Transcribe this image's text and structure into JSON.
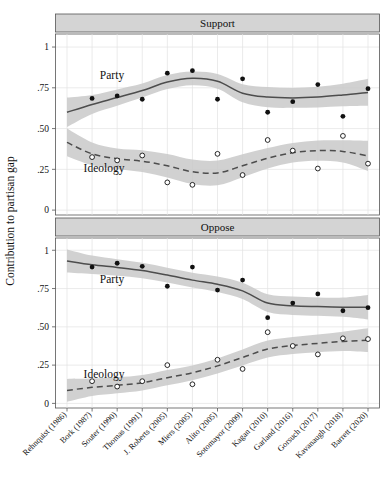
{
  "chart_data": {
    "type": "line",
    "title": "",
    "ylabel": "Contribution to partisan gap",
    "xlabel": "",
    "ylim": [
      -0.03,
      1.08
    ],
    "yticks": [
      0,
      0.25,
      0.5,
      0.75,
      1
    ],
    "ytick_labels": [
      "0",
      ".25",
      ".50",
      ".75",
      "1"
    ],
    "grid": true,
    "legend_position": "inline-annotation",
    "categories": [
      "Rehnquist (1986)",
      "Bork (1987)",
      "Souter (1990)",
      "Thomas (1991)",
      "J. Roberts (2005)",
      "Miers (2005)",
      "Alito (2005)",
      "Sotomayor (2009)",
      "Kagan (2010)",
      "Garland (2016)",
      "Gorsuch (2017)",
      "Kavanaugh (2018)",
      "Barrett (2020)"
    ],
    "panels": [
      {
        "title": "Support",
        "series": [
          {
            "name": "Party",
            "label": "Party",
            "marker": "filled-circle",
            "linestyle": "solid",
            "color": "#4d4d4d",
            "values": [
              null,
              0.685,
              0.7,
              0.68,
              0.84,
              0.855,
              0.68,
              0.805,
              0.6,
              0.665,
              0.77,
              0.575,
              0.745
            ],
            "fit": [
              0.6,
              0.648,
              0.69,
              0.733,
              0.785,
              0.808,
              0.79,
              0.717,
              0.693,
              0.688,
              0.693,
              0.706,
              0.722
            ],
            "ci_low": [
              0.51,
              0.59,
              0.64,
              0.69,
              0.742,
              0.766,
              0.745,
              0.662,
              0.631,
              0.627,
              0.63,
              0.637,
              0.64
            ],
            "ci_high": [
              0.69,
              0.706,
              0.74,
              0.776,
              0.828,
              0.85,
              0.835,
              0.772,
              0.755,
              0.749,
              0.756,
              0.775,
              0.805
            ]
          },
          {
            "name": "Ideology",
            "label": "Ideology",
            "marker": "open-circle",
            "linestyle": "dashed",
            "color": "#4d4d4d",
            "values": [
              null,
              0.325,
              0.305,
              0.335,
              0.17,
              0.155,
              0.345,
              0.215,
              0.43,
              0.365,
              0.255,
              0.455,
              0.285
            ],
            "fit": [
              0.415,
              0.345,
              0.315,
              0.3,
              0.272,
              0.235,
              0.228,
              0.272,
              0.318,
              0.352,
              0.365,
              0.36,
              0.332
            ],
            "ci_low": [
              0.33,
              0.275,
              0.252,
              0.233,
              0.2,
              0.16,
              0.152,
              0.202,
              0.255,
              0.292,
              0.303,
              0.292,
              0.24
            ],
            "ci_high": [
              0.5,
              0.415,
              0.378,
              0.367,
              0.344,
              0.31,
              0.304,
              0.342,
              0.381,
              0.412,
              0.427,
              0.428,
              0.425
            ]
          }
        ]
      },
      {
        "title": "Oppose",
        "series": [
          {
            "name": "Party",
            "label": "Party",
            "marker": "filled-circle",
            "linestyle": "solid",
            "color": "#4d4d4d",
            "values": [
              null,
              0.89,
              0.915,
              0.895,
              0.765,
              0.89,
              0.74,
              0.805,
              0.56,
              0.655,
              0.715,
              0.605,
              0.625
            ],
            "fit": [
              0.93,
              0.905,
              0.888,
              0.868,
              0.838,
              0.805,
              0.778,
              0.735,
              0.655,
              0.638,
              0.632,
              0.628,
              0.628
            ],
            "ci_low": [
              0.855,
              0.845,
              0.834,
              0.818,
              0.79,
              0.757,
              0.728,
              0.682,
              0.597,
              0.578,
              0.572,
              0.565,
              0.548
            ],
            "ci_high": [
              1.005,
              0.965,
              0.942,
              0.918,
              0.886,
              0.853,
              0.828,
              0.788,
              0.713,
              0.698,
              0.692,
              0.691,
              0.708
            ]
          },
          {
            "name": "Ideology",
            "label": "Ideology",
            "marker": "open-circle",
            "linestyle": "dashed",
            "color": "#4d4d4d",
            "values": [
              null,
              0.145,
              0.11,
              0.145,
              0.25,
              0.125,
              0.285,
              0.225,
              0.465,
              0.375,
              0.32,
              0.425,
              0.42
            ],
            "fit": [
              0.085,
              0.105,
              0.118,
              0.135,
              0.168,
              0.2,
              0.245,
              0.3,
              0.355,
              0.378,
              0.392,
              0.405,
              0.412
            ],
            "ci_low": [
              0.01,
              0.048,
              0.066,
              0.085,
              0.118,
              0.152,
              0.196,
              0.248,
              0.3,
              0.322,
              0.334,
              0.342,
              0.335
            ],
            "ci_high": [
              0.16,
              0.162,
              0.17,
              0.185,
              0.218,
              0.248,
              0.294,
              0.352,
              0.41,
              0.434,
              0.45,
              0.468,
              0.49
            ]
          }
        ]
      }
    ],
    "colors": {
      "band": "#c9c9c9",
      "line": "#4d4d4d",
      "marker": "#111111",
      "grid": "#e2e2e2",
      "frame": "#555555",
      "panel_header": "#d4d4d4"
    }
  }
}
